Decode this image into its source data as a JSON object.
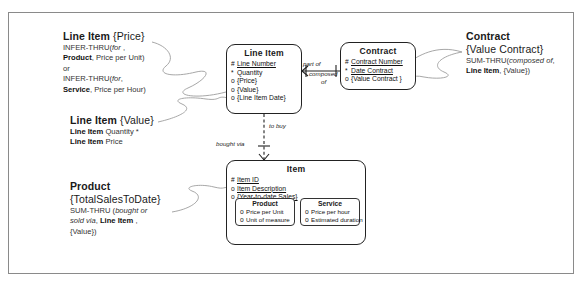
{
  "diagram": {
    "frame": {
      "label": "diagram-border"
    },
    "annotations": [
      {
        "id": "line-item-price",
        "header_bold": "Line Item",
        "header_brace": "{Price}",
        "lines": [
          [
            {
              "t": "INFER-THRU(",
              "s": "n"
            },
            {
              "t": "for",
              "s": "i"
            },
            {
              "t": " ,",
              "s": "n"
            }
          ],
          [
            {
              "t": "Product",
              "s": "b"
            },
            {
              "t": ", Price per Unit)",
              "s": "n"
            }
          ],
          [
            {
              "t": "or",
              "s": "n"
            }
          ],
          [
            {
              "t": "INFER-THRU(",
              "s": "n"
            },
            {
              "t": "for",
              "s": "i"
            },
            {
              "t": ",",
              "s": "n"
            }
          ],
          [
            {
              "t": "Service",
              "s": "b"
            },
            {
              "t": ", Price per Hour)",
              "s": "n"
            }
          ]
        ]
      },
      {
        "id": "line-item-value",
        "header_bold": "Line Item",
        "header_brace": "{Value}",
        "lines": [
          [
            {
              "t": "Line Item",
              "s": "b"
            },
            {
              "t": " Quantity *",
              "s": "n"
            }
          ],
          [
            {
              "t": "Line Item",
              "s": "b"
            },
            {
              "t": " Price",
              "s": "n"
            }
          ]
        ]
      },
      {
        "id": "product-total-sales",
        "header_bold": "Product",
        "header_brace": "{TotalSalesToDate}",
        "lines": [
          [
            {
              "t": "SUM-THRU (",
              "s": "n"
            },
            {
              "t": "bought or",
              "s": "i"
            }
          ],
          [
            {
              "t": "sold via",
              "s": "i"
            },
            {
              "t": ", ",
              "s": "n"
            },
            {
              "t": "Line Item",
              "s": "b"
            },
            {
              "t": " ,",
              "s": "n"
            }
          ],
          [
            {
              "t": "{Value})",
              "s": "n"
            }
          ]
        ]
      },
      {
        "id": "contract-value-contract",
        "header_bold": "Contract",
        "header_brace": "{Value Contract}",
        "lines": [
          [
            {
              "t": "SUM-THRU(",
              "s": "n"
            },
            {
              "t": "composed of",
              "s": "i"
            },
            {
              "t": ",",
              "s": "n"
            }
          ],
          [
            {
              "t": "Line Item",
              "s": "b"
            },
            {
              "t": ", {Value})",
              "s": "n"
            }
          ]
        ]
      }
    ],
    "entities": [
      {
        "id": "line-item",
        "title": "Line Item",
        "attributes": [
          {
            "marker": "#",
            "name": "Line Number",
            "underline": true
          },
          {
            "marker": "*",
            "name": "Quantity",
            "underline": false
          },
          {
            "marker": "o",
            "name": "{Price}",
            "underline": false
          },
          {
            "marker": "o",
            "name": "{Value}",
            "underline": false
          },
          {
            "marker": "o",
            "name": "{Line Item Date}",
            "underline": false
          }
        ]
      },
      {
        "id": "contract",
        "title": "Contract",
        "attributes": [
          {
            "marker": "#",
            "name": "Contract Number",
            "underline": true
          },
          {
            "marker": "*",
            "name": "Date Contract",
            "underline": true
          },
          {
            "marker": "o",
            "name": "{Value Contract }",
            "underline": false
          }
        ]
      },
      {
        "id": "item",
        "title": "Item",
        "attributes": [
          {
            "marker": "#",
            "name": "Item ID",
            "underline": true
          },
          {
            "marker": "o",
            "name": "Item Description",
            "underline": true
          },
          {
            "marker": "o",
            "name": "{Year-to-date Sales}",
            "underline": true
          }
        ],
        "subtypes": [
          {
            "id": "product",
            "title": "Product",
            "attributes": [
              {
                "marker": "o",
                "name": "Price per Unit",
                "underline": false
              },
              {
                "marker": "o",
                "name": "Unit of measure",
                "underline": false
              }
            ]
          },
          {
            "id": "service",
            "title": "Service",
            "attributes": [
              {
                "marker": "o",
                "name": "Price per hour",
                "underline": false
              },
              {
                "marker": "o",
                "name": "Estimated duration",
                "underline": false
              }
            ]
          }
        ]
      }
    ],
    "relationship_labels": [
      {
        "id": "part-of",
        "text": "part of"
      },
      {
        "id": "composed-of-1",
        "text": "composed"
      },
      {
        "id": "composed-of-2",
        "text": "of"
      },
      {
        "id": "to-buy",
        "text": "to buy"
      },
      {
        "id": "bought-via",
        "text": "bought via"
      }
    ],
    "colors": {
      "ink": "#1a1a1a",
      "frame": "#8a8a8a",
      "entity_border": "#222222",
      "connector": "#9a9a9a"
    }
  }
}
